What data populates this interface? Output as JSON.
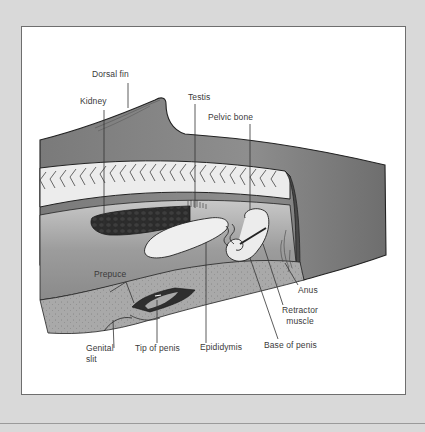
{
  "diagram": {
    "colors": {
      "page_background": "#d9d9d9",
      "panel_background": "#ffffff",
      "panel_border": "#6e6e6e",
      "body_gray": "#8c8c8c",
      "dark_tissue": "#3a3a3a",
      "light_organ": "#e8e8e8",
      "blubber": "#b9b9b9"
    },
    "labels": {
      "dorsal_fin": "Dorsal fin",
      "kidney": "Kidney",
      "testis": "Testis",
      "pelvic_bone": "Pelvic bone",
      "prepuce": "Prepuce",
      "anus": "Anus",
      "retractor_muscle_line1": "Retractor",
      "retractor_muscle_line2": "muscle",
      "genital_slit_line1": "Genital",
      "genital_slit_line2": "slit",
      "tip_of_penis": "Tip of penis",
      "epididymis": "Epididymis",
      "base_of_penis": "Base of penis"
    }
  }
}
